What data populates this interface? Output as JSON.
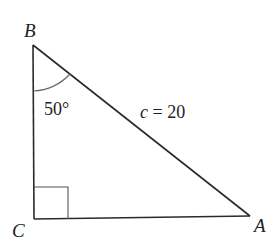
{
  "diagram": {
    "type": "right-triangle",
    "colors": {
      "stroke": "#2a2a2a",
      "angle_arc": "#666666",
      "text": "#222222",
      "background": "#ffffff"
    },
    "vertices": [
      {
        "label": "B",
        "x": 33,
        "y": 45
      },
      {
        "label": "C",
        "x": 34,
        "y": 219
      },
      {
        "label": "A",
        "x": 250,
        "y": 216
      }
    ],
    "angle_label": "50°",
    "hypotenuse": {
      "var": "c",
      "eq": " = 20"
    },
    "right_angle_at": "C"
  }
}
